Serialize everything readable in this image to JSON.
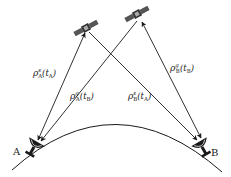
{
  "diagram": {
    "type": "satellite-ranging-geometry",
    "stations": [
      {
        "id": "A",
        "label": "A"
      },
      {
        "id": "B",
        "label": "B"
      }
    ],
    "satellites": [
      {
        "id": "s",
        "position": "left"
      },
      {
        "id": "g",
        "position": "right"
      }
    ],
    "ranges": [
      {
        "symbol": "ρ",
        "sup": "s",
        "sub": "A",
        "t": "t",
        "tsub": "A",
        "text": "ρ^s_A(t_A)"
      },
      {
        "symbol": "ρ",
        "sup": "g",
        "sub": "A",
        "t": "t",
        "tsub": "B",
        "text": "ρ^g_A(t_B)"
      },
      {
        "symbol": "ρ",
        "sup": "s",
        "sub": "B",
        "t": "t",
        "tsub": "A",
        "text": "ρ^s_B(t_A)"
      },
      {
        "symbol": "ρ",
        "sup": "g",
        "sub": "B",
        "t": "t",
        "tsub": "B",
        "text": "ρ^g_B(t_B)"
      }
    ],
    "colors": {
      "line": "#1a1a1a",
      "background": "#ffffff"
    }
  }
}
